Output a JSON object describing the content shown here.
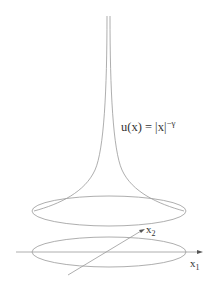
{
  "figure": {
    "formula": {
      "base": "u(x) = |x|",
      "exponent": "−γ"
    },
    "axes": {
      "x1": {
        "base": "x",
        "sub": "1"
      },
      "x2": {
        "base": "x",
        "sub": "2"
      }
    },
    "line_color": "#999999",
    "text_color": "#333333"
  }
}
